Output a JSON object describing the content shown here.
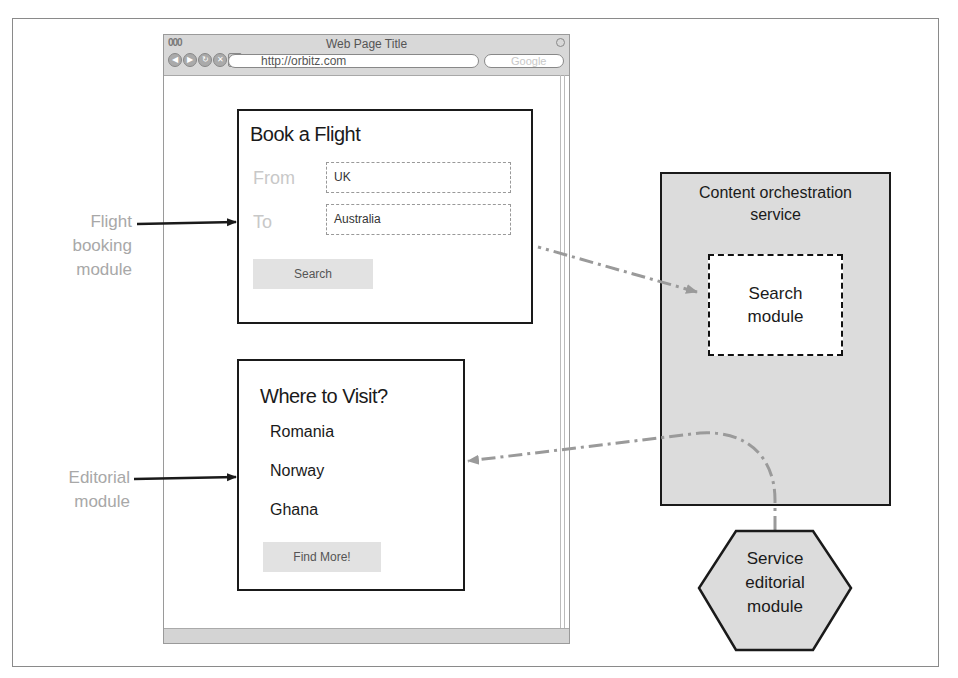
{
  "browser": {
    "window_title": "Web Page Title",
    "url": "http://orbitz.com",
    "search_placeholder": "Google",
    "traffic_lights": "000",
    "nav_buttons": [
      "back",
      "forward",
      "reload",
      "stop",
      "add"
    ]
  },
  "flight_module": {
    "title": "Book a Flight",
    "from_label": "From",
    "from_value": "UK",
    "to_label": "To",
    "to_value": "Australia",
    "search_button": "Search"
  },
  "editorial_module": {
    "title": "Where to Visit?",
    "places": [
      "Romania",
      "Norway",
      "Ghana"
    ],
    "find_more_button": "Find More!"
  },
  "annotations": {
    "flight_booking_label": [
      "Flight",
      "booking",
      "module"
    ],
    "editorial_label": [
      "Editorial",
      "module"
    ]
  },
  "services": {
    "orchestration_title": [
      "Content orchestration",
      "service"
    ],
    "search_module": [
      "Search",
      "module"
    ],
    "editorial_service": [
      "Service",
      "editorial",
      "module"
    ]
  },
  "colors": {
    "border": "#1a1a1a",
    "service_fill": "#dcdcdc",
    "arrow_dashed": "#9a9a9a",
    "label_grey": "#a8a8a8"
  }
}
